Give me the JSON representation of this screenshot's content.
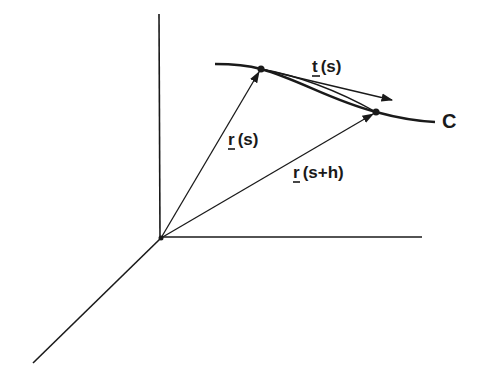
{
  "figure": {
    "title": "",
    "colors": {
      "ink": "#1a1a1a",
      "background": "#ffffff"
    }
  },
  "labels": {
    "tangent": {
      "vec": "t",
      "arg": "(s)"
    },
    "position_s": {
      "vec": "r",
      "arg": "(s)"
    },
    "position_sh": {
      "vec": "r",
      "arg": "(s+h)"
    },
    "curve": "C"
  },
  "points": [
    {
      "name": "r(s)",
      "x": 261,
      "y": 69
    },
    {
      "name": "r(s+h)",
      "x": 376,
      "y": 112
    }
  ],
  "axes": {
    "origin": {
      "x": 161,
      "y": 238
    },
    "vertical_top": {
      "x": 159,
      "y": 14
    },
    "horizontal_end": {
      "x": 422,
      "y": 237
    },
    "diagonal_end": {
      "x": 33,
      "y": 363
    }
  }
}
